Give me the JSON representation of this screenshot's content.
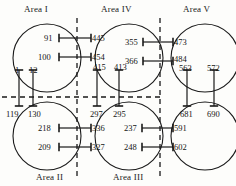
{
  "diagram": {
    "type": "node-link-partition",
    "colors": {
      "stroke": "#1a1a1a",
      "dashed": "#1a1a1a",
      "background": "#fdfdfb",
      "text": "#141414"
    },
    "area_labels": [
      {
        "id": "area-1",
        "text": "Area I",
        "x": 24,
        "y": 4
      },
      {
        "id": "area-4",
        "text": "Area IV",
        "x": 101,
        "y": 4
      },
      {
        "id": "area-5",
        "text": "Area V",
        "x": 183,
        "y": 4
      },
      {
        "id": "area-2",
        "text": "Area II",
        "x": 36,
        "y": 172
      },
      {
        "id": "area-3",
        "text": "Area III",
        "x": 113,
        "y": 172
      }
    ],
    "circles": [
      {
        "id": "circle-area-1",
        "cx": 47,
        "cy": 58,
        "r": 34
      },
      {
        "id": "circle-area-4",
        "cx": 129,
        "cy": 58,
        "r": 34
      },
      {
        "id": "circle-area-5",
        "cx": 205,
        "cy": 58,
        "r": 34
      },
      {
        "id": "circle-area-2",
        "cx": 47,
        "cy": 136,
        "r": 34
      },
      {
        "id": "circle-area-3",
        "cx": 129,
        "cy": 136,
        "r": 34
      },
      {
        "id": "circle-area-6",
        "cx": 205,
        "cy": 136,
        "r": 34
      }
    ],
    "dashed_lines": {
      "vertical": [
        {
          "id": "divider-v-left",
          "x": 77,
          "y1": 18,
          "y2": 178
        },
        {
          "id": "divider-v-right",
          "x": 160,
          "y1": 18,
          "y2": 178
        }
      ],
      "horizontal": [
        {
          "id": "divider-h",
          "y": 97,
          "x1": 2,
          "x2": 162
        }
      ]
    },
    "numbers": [
      {
        "id": "n-91",
        "text": "91",
        "x": 44,
        "y": 34
      },
      {
        "id": "n-100",
        "text": "100",
        "x": 38,
        "y": 53
      },
      {
        "id": "n-1",
        "text": "1",
        "x": 15,
        "y": 66
      },
      {
        "id": "n-12",
        "text": "12",
        "x": 29,
        "y": 66
      },
      {
        "id": "n-445",
        "text": "445",
        "x": 92,
        "y": 34
      },
      {
        "id": "n-454",
        "text": "454",
        "x": 92,
        "y": 53
      },
      {
        "id": "n-415",
        "text": "415",
        "x": 93,
        "y": 63
      },
      {
        "id": "n-413",
        "text": "413",
        "x": 114,
        "y": 63
      },
      {
        "id": "n-355",
        "text": "355",
        "x": 125,
        "y": 38
      },
      {
        "id": "n-366",
        "text": "366",
        "x": 125,
        "y": 57
      },
      {
        "id": "n-473",
        "text": "473",
        "x": 174,
        "y": 38
      },
      {
        "id": "n-484",
        "text": "484",
        "x": 174,
        "y": 55
      },
      {
        "id": "n-563",
        "text": "563",
        "x": 179,
        "y": 64
      },
      {
        "id": "n-572",
        "text": "572",
        "x": 207,
        "y": 64
      },
      {
        "id": "n-119",
        "text": "119",
        "x": 6,
        "y": 110
      },
      {
        "id": "n-130",
        "text": "130",
        "x": 28,
        "y": 110
      },
      {
        "id": "n-218",
        "text": "218",
        "x": 38,
        "y": 124
      },
      {
        "id": "n-209",
        "text": "209",
        "x": 38,
        "y": 143
      },
      {
        "id": "n-297",
        "text": "297",
        "x": 90,
        "y": 110
      },
      {
        "id": "n-295",
        "text": "295",
        "x": 113,
        "y": 110
      },
      {
        "id": "n-336",
        "text": "336",
        "x": 92,
        "y": 124
      },
      {
        "id": "n-327",
        "text": "327",
        "x": 92,
        "y": 143
      },
      {
        "id": "n-237",
        "text": "237",
        "x": 124,
        "y": 124
      },
      {
        "id": "n-248",
        "text": "248",
        "x": 124,
        "y": 143
      },
      {
        "id": "n-681",
        "text": "681",
        "x": 180,
        "y": 110
      },
      {
        "id": "n-690",
        "text": "690",
        "x": 207,
        "y": 110
      },
      {
        "id": "n-591",
        "text": "591",
        "x": 174,
        "y": 124
      },
      {
        "id": "n-602",
        "text": "602",
        "x": 174,
        "y": 143
      }
    ],
    "connectors": {
      "horizontal_links": [
        {
          "id": "link-91-445",
          "y": 38,
          "x1": 59,
          "x2": 91,
          "leftcap": true,
          "rightcap": true
        },
        {
          "id": "link-100-454",
          "y": 57,
          "x1": 59,
          "x2": 91,
          "leftcap": true,
          "rightcap": true
        },
        {
          "id": "link-355-473",
          "y": 42,
          "x1": 143,
          "x2": 173,
          "leftcap": true,
          "rightcap": true
        },
        {
          "id": "link-366-484",
          "y": 61,
          "x1": 143,
          "x2": 173,
          "leftcap": true,
          "rightcap": true
        },
        {
          "id": "link-218-336",
          "y": 128,
          "x1": 59,
          "x2": 91,
          "leftcap": true,
          "rightcap": true
        },
        {
          "id": "link-209-327",
          "y": 147,
          "x1": 59,
          "x2": 91,
          "leftcap": true,
          "rightcap": true
        },
        {
          "id": "link-237-591",
          "y": 128,
          "x1": 142,
          "x2": 173,
          "leftcap": true,
          "rightcap": true
        },
        {
          "id": "link-248-602",
          "y": 147,
          "x1": 142,
          "x2": 173,
          "leftcap": true,
          "rightcap": true
        }
      ],
      "vertical_links": [
        {
          "id": "link-1-119",
          "x": 19,
          "y1": 70,
          "y2": 106,
          "topcap": true,
          "botcap": true
        },
        {
          "id": "link-12-130",
          "x": 33,
          "y1": 70,
          "y2": 106,
          "topcap": true,
          "botcap": true
        },
        {
          "id": "link-415-297",
          "x": 97,
          "y1": 70,
          "y2": 106,
          "topcap": true,
          "botcap": true
        },
        {
          "id": "link-413-295",
          "x": 119,
          "y1": 70,
          "y2": 106,
          "topcap": true,
          "botcap": true
        },
        {
          "id": "link-563-681",
          "x": 187,
          "y1": 70,
          "y2": 106,
          "topcap": true,
          "botcap": true
        },
        {
          "id": "link-572-690",
          "x": 214,
          "y1": 70,
          "y2": 106,
          "topcap": true,
          "botcap": true
        }
      ]
    }
  }
}
